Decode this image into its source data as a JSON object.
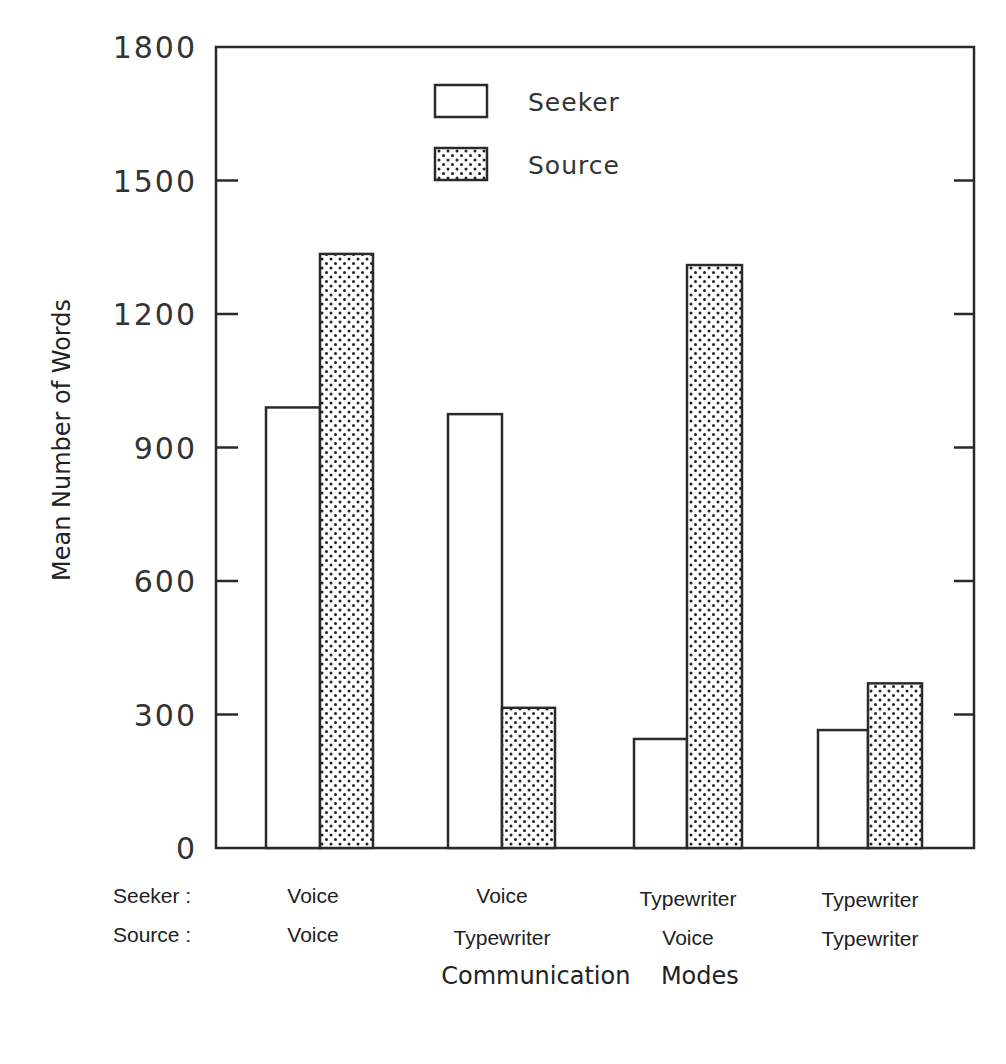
{
  "chart_data": {
    "type": "bar",
    "title": "",
    "xlabel": "Communication Modes",
    "ylabel": "Mean Number of Words",
    "ylim": [
      0,
      1800
    ],
    "yticks": [
      0,
      300,
      600,
      900,
      1200,
      1500,
      1800
    ],
    "grid": false,
    "legend_position": "upper center (inside plot)",
    "row_labels": {
      "seeker": "Seeker :",
      "source": "Source :"
    },
    "categories": [
      {
        "seeker": "Voice",
        "source": "Voice"
      },
      {
        "seeker": "Voice",
        "source": "Typewriter"
      },
      {
        "seeker": "Typewriter",
        "source": "Voice"
      },
      {
        "seeker": "Typewriter",
        "source": "Typewriter"
      }
    ],
    "series": [
      {
        "name": "Seeker",
        "pattern": "open",
        "values": [
          990,
          975,
          245,
          265
        ]
      },
      {
        "name": "Source",
        "pattern": "stippled",
        "values": [
          1335,
          315,
          1310,
          370
        ]
      }
    ]
  },
  "page": {
    "corner_mark": "90"
  }
}
